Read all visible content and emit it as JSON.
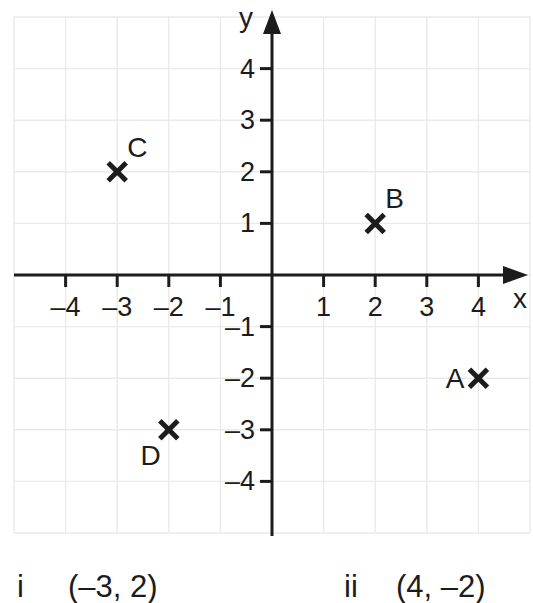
{
  "chart_data": {
    "type": "scatter",
    "title": "",
    "xlabel": "x",
    "ylabel": "y",
    "xlim": [
      -5,
      5
    ],
    "ylim": [
      -5,
      5
    ],
    "grid": true,
    "legend": "none",
    "marker": "x-cross",
    "x_ticks": [
      {
        "value": -4,
        "label": "–4"
      },
      {
        "value": -3,
        "label": "–3"
      },
      {
        "value": -2,
        "label": "–2"
      },
      {
        "value": -1,
        "label": "–1"
      },
      {
        "value": 1,
        "label": "1"
      },
      {
        "value": 2,
        "label": "2"
      },
      {
        "value": 3,
        "label": "3"
      },
      {
        "value": 4,
        "label": "4"
      }
    ],
    "y_ticks": [
      {
        "value": 4,
        "label": "4"
      },
      {
        "value": 3,
        "label": "3"
      },
      {
        "value": 2,
        "label": "2"
      },
      {
        "value": 1,
        "label": "1"
      },
      {
        "value": -1,
        "label": "–1"
      },
      {
        "value": -2,
        "label": "–2"
      },
      {
        "value": -3,
        "label": "–3"
      },
      {
        "value": -4,
        "label": "–4"
      }
    ],
    "points": [
      {
        "name": "A",
        "x": 4,
        "y": -2,
        "label_side": "left"
      },
      {
        "name": "B",
        "x": 2,
        "y": 1,
        "label_side": "upper-right"
      },
      {
        "name": "C",
        "x": -3,
        "y": 2,
        "label_side": "upper-right"
      },
      {
        "name": "D",
        "x": -2,
        "y": -3,
        "label_side": "lower-left"
      }
    ]
  },
  "colors": {
    "axis": "#1c1c1c",
    "grid": "#eaeaea",
    "text": "#1c1c1c",
    "background": "#ffffff"
  },
  "footer": {
    "items": [
      {
        "marker": "i",
        "coords": "(–3, 2)"
      },
      {
        "marker": "ii",
        "coords": "(4, –2)"
      }
    ]
  }
}
